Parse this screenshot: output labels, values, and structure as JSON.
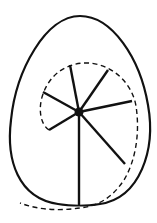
{
  "diagram": {
    "colors": {
      "stroke": "#111111",
      "background": "#ffffff"
    },
    "egg": {
      "path": "M80,16 C112,16 140,58 148,105 C156,150 140,198 100,204 C88,206 70,206 58,204 C18,198 6,160 11,120 C16,70 46,16 80,16 Z"
    },
    "hub": {
      "cx": 79,
      "cy": 112,
      "r": 4.5
    },
    "spokes": [
      {
        "name": "spoke-top",
        "x2": 70,
        "y2": 65
      },
      {
        "name": "spoke-upper-right",
        "x2": 108,
        "y2": 70
      },
      {
        "name": "spoke-right",
        "x2": 132,
        "y2": 101
      },
      {
        "name": "spoke-lower-right",
        "x2": 125,
        "y2": 164
      },
      {
        "name": "spoke-bottom",
        "x2": 79,
        "y2": 205
      },
      {
        "name": "spoke-lower-left",
        "x2": 49,
        "y2": 130
      },
      {
        "name": "spoke-left",
        "x2": 43,
        "y2": 92
      }
    ],
    "spiral": {
      "path": "M49,130 C40,124 38,108 43,94 C50,74 66,64 84,63 C110,62 132,82 136,106 C140,132 136,160 124,180 C112,198 98,206 80,208 C60,211 38,210 20,203"
    }
  }
}
